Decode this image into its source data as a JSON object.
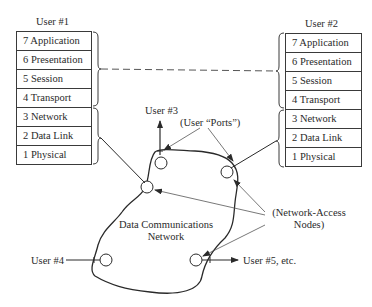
{
  "user1": {
    "title": "User #1",
    "layers": [
      "7 Application",
      "6 Presentation",
      "5 Session",
      "4 Transport",
      "3 Network",
      "2 Data Link",
      "1 Physical"
    ]
  },
  "user2": {
    "title": "User #2",
    "layers": [
      "7 Application",
      "6 Presentation",
      "5 Session",
      "4 Transport",
      "3 Network",
      "2 Data Link",
      "1 Physical"
    ]
  },
  "network": {
    "label_line1": "Data Communications",
    "label_line2": "Network"
  },
  "labels": {
    "user3": "User #3",
    "user4": "User #4",
    "user5": "User #5, etc.",
    "ports": "(User “Ports”)",
    "nodes_line1": "(Network-Access",
    "nodes_line2": "Nodes)"
  },
  "colors": {
    "line": "#3a3a3a",
    "dashed": "#555555",
    "background": "#ffffff"
  }
}
